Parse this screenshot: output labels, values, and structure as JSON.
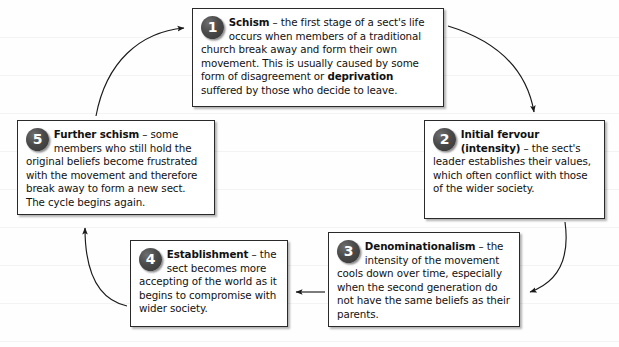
{
  "diagram": {
    "type": "cycle",
    "background_color": "#fefefe",
    "badge_color": "#3d3d3d",
    "line_color": "#1a1a1a",
    "stages": [
      {
        "number": "1",
        "term": "Schism",
        "body": " – the first stage of a sect's life occurs when members of a traditional church break away and form their own movement. This is usually caused by some form of disagreement or ",
        "emphasis": "deprivation",
        "body2": " suffered by those who decide to leave."
      },
      {
        "number": "2",
        "term": "Initial fervour (intensity)",
        "body": " – the sect's leader establishes their values, which often conflict with those of the wider society.",
        "emphasis": "",
        "body2": ""
      },
      {
        "number": "3",
        "term": "Denominationalism",
        "body": " – the intensity of the movement cools down over time, especially when the second generation do not have the same beliefs as their parents.",
        "emphasis": "",
        "body2": ""
      },
      {
        "number": "4",
        "term": "Establishment",
        "body": " – the sect becomes more accepting of the world as it begins to compromise with wider society.",
        "emphasis": "",
        "body2": ""
      },
      {
        "number": "5",
        "term": "Further schism",
        "body": " – some members who still hold the original beliefs become frustrated with the movement and therefore break away to form a new sect. The cycle begins again.",
        "emphasis": "",
        "body2": ""
      }
    ],
    "connectors": [
      {
        "from": "1",
        "to": "2",
        "shape": "curve-right-down"
      },
      {
        "from": "2",
        "to": "3",
        "shape": "curve-down-left"
      },
      {
        "from": "3",
        "to": "4",
        "shape": "straight-left"
      },
      {
        "from": "4",
        "to": "5",
        "shape": "curve-left-up"
      },
      {
        "from": "5",
        "to": "1",
        "shape": "curve-up-right"
      }
    ]
  }
}
